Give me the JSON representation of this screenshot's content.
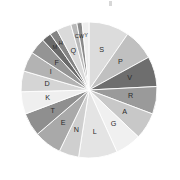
{
  "chart": {
    "title": "",
    "top_mark": ""
  },
  "chart_data": {
    "type": "pie",
    "title": "",
    "subtitle": "",
    "xlabel": "",
    "ylabel": "",
    "legend_position": "none",
    "grid": false,
    "labels_inside_slices": true,
    "start_angle_deg": 0,
    "direction": "clockwise",
    "categories": [
      "S",
      "P",
      "V",
      "R",
      "A",
      "G",
      "L",
      "N",
      "E",
      "T",
      "K",
      "D",
      "I",
      "F",
      "M",
      "H",
      "Q",
      "C",
      "W",
      "Y"
    ],
    "values": [
      9.4,
      7.2,
      7.0,
      6.4,
      6.2,
      6.0,
      9.0,
      4.6,
      6.4,
      5.4,
      5.2,
      4.8,
      4.6,
      3.8,
      2.2,
      1.8,
      3.4,
      1.4,
      1.2,
      1.6
    ],
    "units": "percent",
    "colors": [
      "#dcdcdc",
      "#c0c0c0",
      "#6e6e6e",
      "#9a9a9a",
      "#c8c8c8",
      "#f0f0f0",
      "#e4e4e4",
      "#cfcfcf",
      "#a9a9a9",
      "#8f8f8f",
      "#efefef",
      "#d5d5d5",
      "#b3b3b3",
      "#949494",
      "#6a6a6a",
      "#848484",
      "#dadada",
      "#b8b8b8",
      "#8a8a8a",
      "#efefef"
    ],
    "slices": [
      {
        "label": "S",
        "value": 9.4,
        "color": "#dcdcdc"
      },
      {
        "label": "P",
        "value": 7.2,
        "color": "#c0c0c0"
      },
      {
        "label": "V",
        "value": 7.0,
        "color": "#6e6e6e"
      },
      {
        "label": "R",
        "value": 6.4,
        "color": "#9a9a9a"
      },
      {
        "label": "A",
        "value": 6.2,
        "color": "#c8c8c8"
      },
      {
        "label": "G",
        "value": 6.0,
        "color": "#f0f0f0"
      },
      {
        "label": "L",
        "value": 9.0,
        "color": "#e4e4e4"
      },
      {
        "label": "N",
        "value": 4.6,
        "color": "#cfcfcf"
      },
      {
        "label": "E",
        "value": 6.4,
        "color": "#a9a9a9"
      },
      {
        "label": "T",
        "value": 5.4,
        "color": "#8f8f8f"
      },
      {
        "label": "K",
        "value": 5.2,
        "color": "#efefef"
      },
      {
        "label": "D",
        "value": 4.8,
        "color": "#d5d5d5"
      },
      {
        "label": "I",
        "value": 4.6,
        "color": "#b3b3b3"
      },
      {
        "label": "F",
        "value": 3.8,
        "color": "#949494"
      },
      {
        "label": "M",
        "value": 2.2,
        "color": "#6a6a6a"
      },
      {
        "label": "H",
        "value": 1.8,
        "color": "#848484"
      },
      {
        "label": "Q",
        "value": 3.4,
        "color": "#dadada"
      },
      {
        "label": "C",
        "value": 1.4,
        "color": "#b8b8b8"
      },
      {
        "label": "W",
        "value": 1.2,
        "color": "#8a8a8a"
      },
      {
        "label": "Y",
        "value": 1.6,
        "color": "#efefef"
      }
    ],
    "geometry": {
      "center_x": 89,
      "center_y": 90,
      "radius": 68,
      "label_radius_ratio": 0.62,
      "separator_color": "#ffffff",
      "separator_width": 0.9
    }
  }
}
